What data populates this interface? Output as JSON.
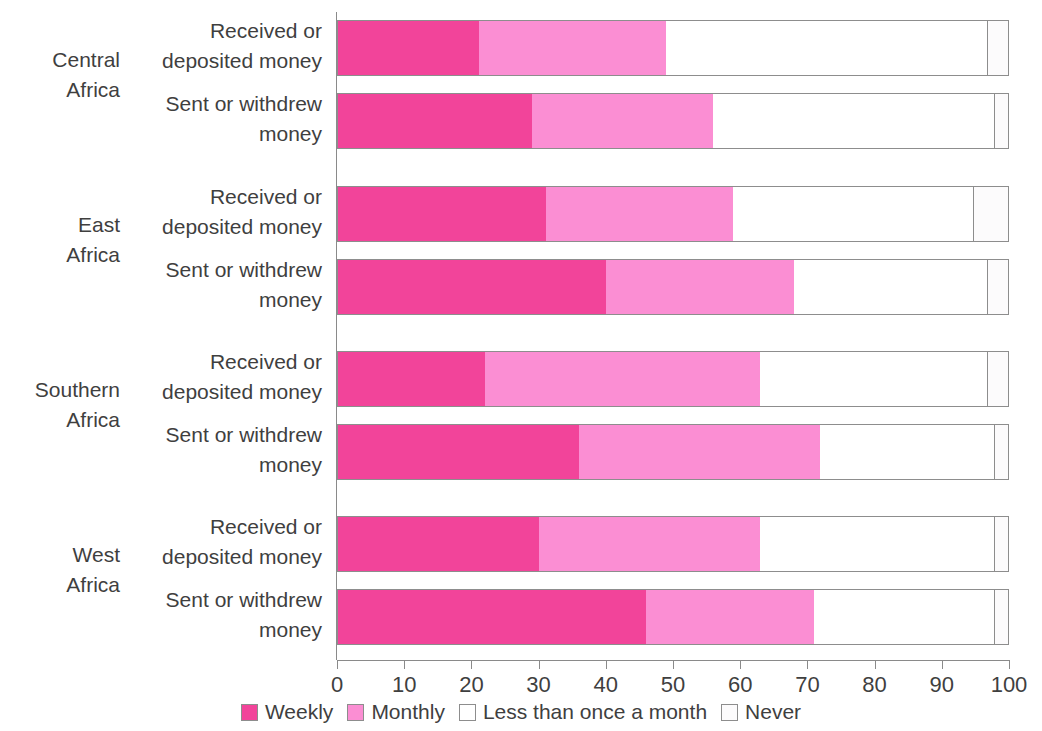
{
  "chart_data": {
    "type": "bar",
    "orientation": "horizontal",
    "stacked": true,
    "stacked_percent": true,
    "title": "",
    "subtitle": "",
    "xlabel": "",
    "ylabel": "",
    "xlim": [
      0,
      100
    ],
    "xticks": [
      0,
      10,
      20,
      30,
      40,
      50,
      60,
      70,
      80,
      90,
      100
    ],
    "xtick_labels": [
      "0",
      "10",
      "20",
      "30",
      "40",
      "50",
      "60",
      "70",
      "80",
      "90",
      "100"
    ],
    "grid": false,
    "legend_position": "bottom-center",
    "series": [
      {
        "name": "Weekly",
        "color": "#f2449a"
      },
      {
        "name": "Monthly",
        "color": "#fb8ed3"
      },
      {
        "name": "Less than once a month",
        "color": "#ffffff"
      },
      {
        "name": "Never",
        "color": "#fcfbfc"
      }
    ],
    "groups": [
      {
        "label_lines": [
          "Central",
          "Africa"
        ],
        "rows": [
          {
            "label_lines": [
              "Received or",
              "deposited money"
            ],
            "values": [
              21,
              28,
              48,
              3
            ]
          },
          {
            "label_lines": [
              "Sent or withdrew",
              "money"
            ],
            "values": [
              29,
              27,
              42,
              2
            ]
          }
        ]
      },
      {
        "label_lines": [
          "East",
          "Africa"
        ],
        "rows": [
          {
            "label_lines": [
              "Received or",
              "deposited money"
            ],
            "values": [
              31,
              28,
              36,
              5
            ]
          },
          {
            "label_lines": [
              "Sent or withdrew",
              "money"
            ],
            "values": [
              40,
              28,
              29,
              3
            ]
          }
        ]
      },
      {
        "label_lines": [
          "Southern",
          "Africa"
        ],
        "rows": [
          {
            "label_lines": [
              "Received or",
              "deposited money"
            ],
            "values": [
              22,
              41,
              34,
              3
            ]
          },
          {
            "label_lines": [
              "Sent or withdrew",
              "money"
            ],
            "values": [
              36,
              36,
              26,
              2
            ]
          }
        ]
      },
      {
        "label_lines": [
          "West",
          "Africa"
        ],
        "rows": [
          {
            "label_lines": [
              "Received or",
              "deposited money"
            ],
            "values": [
              30,
              33,
              35,
              2
            ]
          },
          {
            "label_lines": [
              "Sent or withdrew",
              "money"
            ],
            "values": [
              46,
              25,
              27,
              2
            ]
          }
        ]
      }
    ]
  },
  "legend": {
    "items": [
      {
        "label": "Weekly",
        "color": "#f2449a",
        "style": "filled"
      },
      {
        "label": "Monthly",
        "color": "#fb8ed3",
        "style": "filled"
      },
      {
        "label": "Less than once a month",
        "color": "#ffffff",
        "style": "outline"
      },
      {
        "label": "Never",
        "color": "#fcfbfc",
        "style": "outline"
      }
    ]
  }
}
